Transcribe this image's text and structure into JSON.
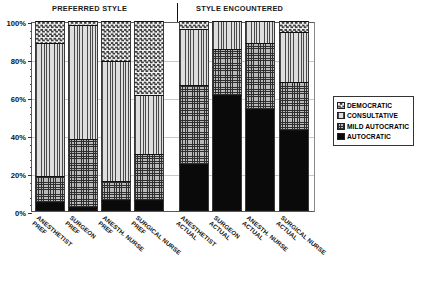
{
  "groups": {
    "left_title": "PREFERRED STYLE",
    "right_title": "STYLE ENCOUNTERED"
  },
  "axis": {
    "ticks": [
      "100%",
      "80%",
      "60%",
      "40%",
      "20%",
      "0%"
    ]
  },
  "legend": {
    "items": [
      {
        "label": "DEMOCRATIC",
        "key": "democratic",
        "pattern": "checkerboard"
      },
      {
        "label": "CONSULTATIVE",
        "key": "consultative",
        "pattern": "vertical-lines"
      },
      {
        "label": "MILD AUTOCRATIC",
        "key": "mild",
        "pattern": "crosshatch-grid"
      },
      {
        "label": "AUTOCRATIC",
        "key": "autocratic",
        "pattern": "solid-black"
      }
    ]
  },
  "chart_data": {
    "type": "bar",
    "title": "",
    "subtitle": "",
    "xlabel": "",
    "ylabel": "",
    "ylim": [
      0,
      100
    ],
    "grid": true,
    "stacked": true,
    "normalized_percent": true,
    "legend_position": "right",
    "group_labels": [
      "PREFERRED STYLE",
      "STYLE ENCOUNTERED"
    ],
    "group_split_after_category": 4,
    "categories": [
      "ANESTHETIST PREF",
      "SURGEON PREF",
      "ANESTH. NURSE PREF",
      "SURGICAL NURSE PREF",
      "ANESTHETIST ACTUAL",
      "SURGEON ACTUAL",
      "ANESTH. NURSE ACTUAL",
      "SURGICAL NURSE ACTUAL"
    ],
    "category_lines": [
      [
        "ANESTHETIST",
        "PREF"
      ],
      [
        "SURGEON",
        "PREF"
      ],
      [
        "ANESTH. NURSE",
        "PREF"
      ],
      [
        "SURGICAL NURSE",
        "PREF"
      ],
      [
        "ANESTHETIST",
        "ACTUAL"
      ],
      [
        "SURGEON",
        "ACTUAL"
      ],
      [
        "ANESTH. NURSE",
        "ACTUAL"
      ],
      [
        "SURGICAL NURSE",
        "ACTUAL"
      ]
    ],
    "series": [
      {
        "name": "AUTOCRATIC",
        "values": [
          5,
          2,
          6,
          6,
          24.5,
          61,
          53.5,
          42.5
        ]
      },
      {
        "name": "MILD AUTOCRATIC",
        "values": [
          13.5,
          36,
          10,
          24,
          42,
          24.5,
          35,
          25.5
        ]
      },
      {
        "name": "CONSULTATIVE",
        "values": [
          70,
          60,
          63,
          31,
          29.5,
          14.5,
          11.5,
          26
        ]
      },
      {
        "name": "DEMOCRATIC",
        "values": [
          11.5,
          2,
          21,
          39,
          4,
          0,
          0,
          6
        ]
      }
    ],
    "stack_tops": [
      [
        5,
        18.5,
        88.5,
        100
      ],
      [
        2,
        38,
        98,
        100
      ],
      [
        6,
        16,
        79,
        100
      ],
      [
        6,
        30,
        61,
        100
      ],
      [
        24.5,
        66.5,
        96,
        100
      ],
      [
        61,
        85.5,
        100,
        100
      ],
      [
        53.5,
        88.5,
        100,
        100
      ],
      [
        42.5,
        68,
        94,
        100
      ]
    ]
  }
}
